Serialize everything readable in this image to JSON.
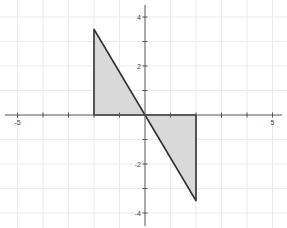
{
  "chart_data": {
    "type": "area",
    "title": "",
    "xlabel": "",
    "ylabel": "",
    "xlim": [
      -5.6,
      5.6
    ],
    "ylim": [
      -4.7,
      4.7
    ],
    "grid": true,
    "x_ticks": [
      -5,
      5
    ],
    "x_tick_labels": [
      "-5",
      "5"
    ],
    "y_ticks": [
      4,
      2,
      -2,
      -4
    ],
    "y_tick_labels": [
      "4",
      "2",
      "-2",
      "-4"
    ],
    "x_minor_ticks": [
      -5,
      -4,
      -3,
      -2,
      -1,
      1,
      2,
      3,
      4,
      5
    ],
    "y_minor_ticks": [
      4,
      3,
      2,
      1,
      -1,
      -2,
      -3,
      -4
    ],
    "shapes": [
      {
        "name": "upper-left-triangle",
        "points": [
          [
            -2,
            0
          ],
          [
            -2,
            3.5
          ],
          [
            0,
            0
          ]
        ]
      },
      {
        "name": "lower-right-triangle",
        "points": [
          [
            0,
            0
          ],
          [
            2,
            0
          ],
          [
            2,
            -3.5
          ]
        ]
      }
    ],
    "colors": {
      "fill": "#d9d9d9",
      "stroke": "#333333",
      "grid": "#ebebeb",
      "axis": "#555555"
    }
  }
}
